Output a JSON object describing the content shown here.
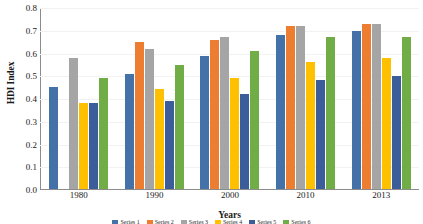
{
  "chart_data": {
    "type": "bar",
    "title": "",
    "xlabel": "Years",
    "ylabel": "HDI Index",
    "categories": [
      "1980",
      "1990",
      "2000",
      "2010",
      "2013"
    ],
    "ylim": [
      0.0,
      0.8
    ],
    "yticks": [
      "0.0",
      "0.1",
      "0.2",
      "0.3",
      "0.4",
      "0.5",
      "0.6",
      "0.7",
      "0.8"
    ],
    "ytick_values": [
      0.0,
      0.1,
      0.2,
      0.3,
      0.4,
      0.5,
      0.6,
      0.7,
      0.8
    ],
    "grid": true,
    "legend_position": "bottom",
    "legend_visible": false,
    "series": [
      {
        "name": "Series 1",
        "color": "#4472A8",
        "values": [
          0.45,
          0.51,
          0.59,
          0.68,
          0.7
        ]
      },
      {
        "name": "Series 2",
        "color": "#ED7D31",
        "values": [
          null,
          0.65,
          0.66,
          0.72,
          0.73
        ]
      },
      {
        "name": "Series 3",
        "color": "#A5A5A5",
        "values": [
          0.58,
          0.62,
          0.67,
          0.72,
          0.73
        ]
      },
      {
        "name": "Series 4",
        "color": "#FFC000",
        "values": [
          0.38,
          0.44,
          0.49,
          0.56,
          0.58
        ]
      },
      {
        "name": "Series 5",
        "color": "#3B5E9B",
        "values": [
          0.38,
          0.39,
          0.42,
          0.48,
          0.5
        ]
      },
      {
        "name": "Series 6",
        "color": "#70AD47",
        "values": [
          0.49,
          0.55,
          0.61,
          0.67,
          0.67
        ]
      }
    ]
  },
  "axis": {
    "y_title": "HDI Index",
    "x_title": "Years"
  }
}
